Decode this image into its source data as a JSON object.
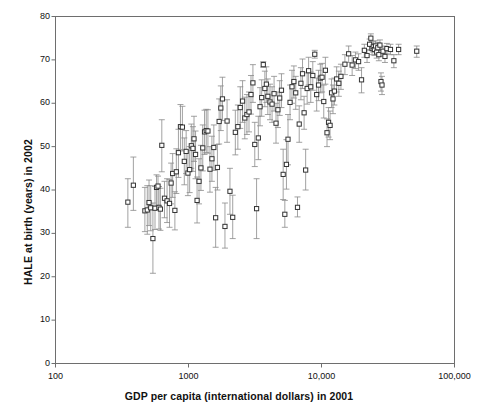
{
  "chart_data": {
    "type": "scatter",
    "title": "",
    "xlabel": "GDP per capita (international dollars) in 2001",
    "ylabel": "HALE at birth (years) in 2002",
    "xscale": "log",
    "yscale": "linear",
    "xlim": [
      100,
      100000
    ],
    "ylim": [
      0,
      80
    ],
    "xticks": [
      100,
      1000,
      10000,
      100000
    ],
    "xticklabels": [
      "100",
      "1000",
      "10,000",
      "100,000"
    ],
    "yticks": [
      0,
      10,
      20,
      30,
      40,
      50,
      60,
      70,
      80
    ],
    "yticklabels": [
      "0",
      "10",
      "20",
      "30",
      "40",
      "50",
      "60",
      "70",
      "80"
    ],
    "grid": false,
    "legend": null,
    "marker": "open-square",
    "marker_color": "#333333",
    "errorbar_color": "#8a8a8a",
    "errorbar_orientation": "vertical",
    "series": [
      {
        "name": "Countries",
        "points": [
          {
            "x": 350,
            "y": 37.2,
            "ylow": 31.4,
            "yhigh": 42.6
          },
          {
            "x": 385,
            "y": 41.1,
            "ylow": 35.3,
            "yhigh": 47.6
          },
          {
            "x": 470,
            "y": 35.2,
            "ylow": 30.4,
            "yhigh": 40.6
          },
          {
            "x": 490,
            "y": 35.4,
            "ylow": 29.8,
            "yhigh": 41.0
          },
          {
            "x": 505,
            "y": 37.1,
            "ylow": 31.8,
            "yhigh": 42.3
          },
          {
            "x": 520,
            "y": 35.9,
            "ylow": 30.6,
            "yhigh": 41.0
          },
          {
            "x": 540,
            "y": 28.8,
            "ylow": 20.8,
            "yhigh": 37.0
          },
          {
            "x": 560,
            "y": 35.8,
            "ylow": 30.9,
            "yhigh": 40.8
          },
          {
            "x": 575,
            "y": 40.6,
            "ylow": 35.7,
            "yhigh": 43.5
          },
          {
            "x": 590,
            "y": 40.9,
            "ylow": 36.3,
            "yhigh": 43.2
          },
          {
            "x": 600,
            "y": 36.0,
            "ylow": 31.0,
            "yhigh": 40.8
          },
          {
            "x": 615,
            "y": 35.6,
            "ylow": 30.7,
            "yhigh": 40.4
          },
          {
            "x": 630,
            "y": 50.3,
            "ylow": 44.2,
            "yhigh": 56.2
          },
          {
            "x": 660,
            "y": 38.1,
            "ylow": 33.6,
            "yhigh": 42.0
          },
          {
            "x": 690,
            "y": 37.5,
            "ylow": 32.5,
            "yhigh": 42.6
          },
          {
            "x": 720,
            "y": 36.9,
            "ylow": 31.4,
            "yhigh": 42.4
          },
          {
            "x": 740,
            "y": 41.6,
            "ylow": 36.8,
            "yhigh": 46.2
          },
          {
            "x": 760,
            "y": 43.8,
            "ylow": 38.3,
            "yhigh": 48.4
          },
          {
            "x": 790,
            "y": 35.3,
            "ylow": 30.8,
            "yhigh": 39.6
          },
          {
            "x": 810,
            "y": 44.2,
            "ylow": 39.2,
            "yhigh": 49.5
          },
          {
            "x": 840,
            "y": 48.6,
            "ylow": 42.9,
            "yhigh": 54.0
          },
          {
            "x": 870,
            "y": 54.6,
            "ylow": 49.3,
            "yhigh": 59.7
          },
          {
            "x": 900,
            "y": 54.5,
            "ylow": 49.0,
            "yhigh": 59.3
          },
          {
            "x": 930,
            "y": 46.6,
            "ylow": 41.2,
            "yhigh": 52.0
          },
          {
            "x": 960,
            "y": 48.9,
            "ylow": 43.8,
            "yhigh": 53.7
          },
          {
            "x": 990,
            "y": 43.9,
            "ylow": 38.7,
            "yhigh": 49.1
          },
          {
            "x": 1020,
            "y": 44.7,
            "ylow": 39.4,
            "yhigh": 50.0
          },
          {
            "x": 1050,
            "y": 50.2,
            "ylow": 45.0,
            "yhigh": 55.2
          },
          {
            "x": 1080,
            "y": 49.6,
            "ylow": 44.3,
            "yhigh": 54.6
          },
          {
            "x": 1100,
            "y": 51.8,
            "ylow": 46.6,
            "yhigh": 57.0
          },
          {
            "x": 1130,
            "y": 48.2,
            "ylow": 42.6,
            "yhigh": 53.6
          },
          {
            "x": 1160,
            "y": 37.6,
            "ylow": 32.4,
            "yhigh": 43.0
          },
          {
            "x": 1200,
            "y": 42.0,
            "ylow": 36.8,
            "yhigh": 47.2
          },
          {
            "x": 1240,
            "y": 45.1,
            "ylow": 39.9,
            "yhigh": 50.3
          },
          {
            "x": 1280,
            "y": 49.7,
            "ylow": 44.4,
            "yhigh": 55.0
          },
          {
            "x": 1320,
            "y": 53.4,
            "ylow": 48.2,
            "yhigh": 58.4
          },
          {
            "x": 1360,
            "y": 53.7,
            "ylow": 48.6,
            "yhigh": 58.6
          },
          {
            "x": 1400,
            "y": 53.6,
            "ylow": 48.5,
            "yhigh": 58.5
          },
          {
            "x": 1450,
            "y": 44.8,
            "ylow": 39.5,
            "yhigh": 50.0
          },
          {
            "x": 1500,
            "y": 47.2,
            "ylow": 42.0,
            "yhigh": 52.4
          },
          {
            "x": 1550,
            "y": 49.8,
            "ylow": 44.5,
            "yhigh": 55.0
          },
          {
            "x": 1600,
            "y": 33.6,
            "ylow": 26.8,
            "yhigh": 40.6
          },
          {
            "x": 1650,
            "y": 45.2,
            "ylow": 40.0,
            "yhigh": 50.5
          },
          {
            "x": 1700,
            "y": 55.8,
            "ylow": 50.6,
            "yhigh": 61.0
          },
          {
            "x": 1750,
            "y": 58.9,
            "ylow": 53.7,
            "yhigh": 64.0
          },
          {
            "x": 1800,
            "y": 61.0,
            "ylow": 56.0,
            "yhigh": 66.0
          },
          {
            "x": 1880,
            "y": 31.6,
            "ylow": 26.6,
            "yhigh": 37.0
          },
          {
            "x": 1950,
            "y": 55.9,
            "ylow": 51.0,
            "yhigh": 60.8
          },
          {
            "x": 2050,
            "y": 39.7,
            "ylow": 34.4,
            "yhigh": 45.0
          },
          {
            "x": 2150,
            "y": 33.7,
            "ylow": 28.8,
            "yhigh": 38.8
          },
          {
            "x": 2250,
            "y": 53.3,
            "ylow": 48.1,
            "yhigh": 58.4
          },
          {
            "x": 2350,
            "y": 54.6,
            "ylow": 49.4,
            "yhigh": 59.6
          },
          {
            "x": 2450,
            "y": 59.0,
            "ylow": 54.2,
            "yhigh": 63.8
          },
          {
            "x": 2550,
            "y": 60.5,
            "ylow": 55.6,
            "yhigh": 65.2
          },
          {
            "x": 2650,
            "y": 56.6,
            "ylow": 51.8,
            "yhigh": 61.4
          },
          {
            "x": 2750,
            "y": 57.4,
            "ylow": 52.8,
            "yhigh": 62.0
          },
          {
            "x": 2850,
            "y": 58.0,
            "ylow": 53.4,
            "yhigh": 62.6
          },
          {
            "x": 2950,
            "y": 62.0,
            "ylow": 57.5,
            "yhigh": 66.4
          },
          {
            "x": 3050,
            "y": 64.7,
            "ylow": 60.2,
            "yhigh": 68.9
          },
          {
            "x": 3150,
            "y": 50.5,
            "ylow": 45.4,
            "yhigh": 55.6
          },
          {
            "x": 3250,
            "y": 35.7,
            "ylow": 28.8,
            "yhigh": 42.6
          },
          {
            "x": 3350,
            "y": 52.0,
            "ylow": 47.0,
            "yhigh": 57.0
          },
          {
            "x": 3450,
            "y": 59.2,
            "ylow": 54.8,
            "yhigh": 63.6
          },
          {
            "x": 3550,
            "y": 61.3,
            "ylow": 57.0,
            "yhigh": 65.4
          },
          {
            "x": 3650,
            "y": 68.9,
            "ylow": 68.3,
            "yhigh": 69.6
          },
          {
            "x": 3750,
            "y": 63.4,
            "ylow": 59.2,
            "yhigh": 67.4
          },
          {
            "x": 3850,
            "y": 64.4,
            "ylow": 60.2,
            "yhigh": 68.4
          },
          {
            "x": 3950,
            "y": 61.6,
            "ylow": 57.4,
            "yhigh": 65.6
          },
          {
            "x": 4100,
            "y": 60.3,
            "ylow": 56.2,
            "yhigh": 64.4
          },
          {
            "x": 4250,
            "y": 59.8,
            "ylow": 55.6,
            "yhigh": 63.8
          },
          {
            "x": 4400,
            "y": 62.2,
            "ylow": 58.2,
            "yhigh": 66.2
          },
          {
            "x": 4550,
            "y": 55.4,
            "ylow": 50.8,
            "yhigh": 60.0
          },
          {
            "x": 4700,
            "y": 58.5,
            "ylow": 54.4,
            "yhigh": 62.6
          },
          {
            "x": 4850,
            "y": 61.2,
            "ylow": 57.2,
            "yhigh": 65.2
          },
          {
            "x": 5000,
            "y": 63.0,
            "ylow": 59.0,
            "yhigh": 66.8
          },
          {
            "x": 5150,
            "y": 43.6,
            "ylow": 37.8,
            "yhigh": 49.4
          },
          {
            "x": 5300,
            "y": 34.4,
            "ylow": 31.4,
            "yhigh": 37.6
          },
          {
            "x": 5450,
            "y": 45.9,
            "ylow": 40.2,
            "yhigh": 51.6
          },
          {
            "x": 5600,
            "y": 51.7,
            "ylow": 45.8,
            "yhigh": 57.4
          },
          {
            "x": 5800,
            "y": 60.2,
            "ylow": 56.2,
            "yhigh": 64.2
          },
          {
            "x": 6000,
            "y": 63.8,
            "ylow": 60.0,
            "yhigh": 67.6
          },
          {
            "x": 6200,
            "y": 65.0,
            "ylow": 61.2,
            "yhigh": 68.6
          },
          {
            "x": 6400,
            "y": 62.4,
            "ylow": 58.6,
            "yhigh": 66.2
          },
          {
            "x": 6600,
            "y": 36.0,
            "ylow": 33.8,
            "yhigh": 38.4
          },
          {
            "x": 6800,
            "y": 55.2,
            "ylow": 51.0,
            "yhigh": 59.4
          },
          {
            "x": 7000,
            "y": 64.6,
            "ylow": 60.8,
            "yhigh": 68.2
          },
          {
            "x": 7200,
            "y": 66.8,
            "ylow": 63.4,
            "yhigh": 70.2
          },
          {
            "x": 7400,
            "y": 57.8,
            "ylow": 54.0,
            "yhigh": 61.6
          },
          {
            "x": 7600,
            "y": 44.6,
            "ylow": 40.0,
            "yhigh": 49.4
          },
          {
            "x": 7800,
            "y": 63.4,
            "ylow": 59.8,
            "yhigh": 67.0
          },
          {
            "x": 8000,
            "y": 67.5,
            "ylow": 64.2,
            "yhigh": 70.6
          },
          {
            "x": 8300,
            "y": 63.8,
            "ylow": 60.2,
            "yhigh": 67.2
          },
          {
            "x": 8600,
            "y": 66.4,
            "ylow": 63.0,
            "yhigh": 69.6
          },
          {
            "x": 8900,
            "y": 71.3,
            "ylow": 70.4,
            "yhigh": 72.2
          },
          {
            "x": 9200,
            "y": 62.0,
            "ylow": 58.2,
            "yhigh": 65.8
          },
          {
            "x": 9500,
            "y": 64.2,
            "ylow": 60.6,
            "yhigh": 67.6
          },
          {
            "x": 9800,
            "y": 65.8,
            "ylow": 62.4,
            "yhigh": 69.0
          },
          {
            "x": 10100,
            "y": 66.0,
            "ylow": 62.6,
            "yhigh": 69.2
          },
          {
            "x": 10400,
            "y": 60.4,
            "ylow": 56.6,
            "yhigh": 64.2
          },
          {
            "x": 10700,
            "y": 67.6,
            "ylow": 64.4,
            "yhigh": 70.6
          },
          {
            "x": 11000,
            "y": 53.2,
            "ylow": 50.0,
            "yhigh": 56.4
          },
          {
            "x": 11300,
            "y": 55.6,
            "ylow": 52.2,
            "yhigh": 59.0
          },
          {
            "x": 11600,
            "y": 54.9,
            "ylow": 51.6,
            "yhigh": 58.2
          },
          {
            "x": 11900,
            "y": 62.4,
            "ylow": 59.0,
            "yhigh": 65.6
          },
          {
            "x": 12200,
            "y": 61.0,
            "ylow": 57.6,
            "yhigh": 64.2
          },
          {
            "x": 12500,
            "y": 62.8,
            "ylow": 59.6,
            "yhigh": 65.8
          },
          {
            "x": 13000,
            "y": 65.6,
            "ylow": 62.6,
            "yhigh": 68.4
          },
          {
            "x": 13500,
            "y": 64.6,
            "ylow": 61.6,
            "yhigh": 67.4
          },
          {
            "x": 14000,
            "y": 66.2,
            "ylow": 63.2,
            "yhigh": 69.0
          },
          {
            "x": 15000,
            "y": 69.0,
            "ylow": 66.6,
            "yhigh": 71.2
          },
          {
            "x": 16000,
            "y": 71.4,
            "ylow": 69.4,
            "yhigh": 73.2
          },
          {
            "x": 17000,
            "y": 68.8,
            "ylow": 66.4,
            "yhigh": 71.0
          },
          {
            "x": 18000,
            "y": 70.0,
            "ylow": 68.0,
            "yhigh": 71.8
          },
          {
            "x": 19000,
            "y": 69.6,
            "ylow": 67.6,
            "yhigh": 71.4
          },
          {
            "x": 20000,
            "y": 65.4,
            "ylow": 62.4,
            "yhigh": 68.2
          },
          {
            "x": 21000,
            "y": 72.2,
            "ylow": 70.6,
            "yhigh": 73.6
          },
          {
            "x": 22000,
            "y": 71.0,
            "ylow": 69.4,
            "yhigh": 72.4
          },
          {
            "x": 23000,
            "y": 73.6,
            "ylow": 72.2,
            "yhigh": 74.8
          },
          {
            "x": 23500,
            "y": 75.0,
            "ylow": 73.8,
            "yhigh": 76.0
          },
          {
            "x": 24000,
            "y": 72.6,
            "ylow": 71.2,
            "yhigh": 73.8
          },
          {
            "x": 24500,
            "y": 73.0,
            "ylow": 71.8,
            "yhigh": 74.2
          },
          {
            "x": 25000,
            "y": 72.4,
            "ylow": 71.0,
            "yhigh": 73.6
          },
          {
            "x": 25500,
            "y": 73.2,
            "ylow": 72.0,
            "yhigh": 74.4
          },
          {
            "x": 26000,
            "y": 71.8,
            "ylow": 70.4,
            "yhigh": 73.0
          },
          {
            "x": 26500,
            "y": 72.8,
            "ylow": 71.6,
            "yhigh": 74.0
          },
          {
            "x": 27000,
            "y": 71.2,
            "ylow": 69.8,
            "yhigh": 72.4
          },
          {
            "x": 27500,
            "y": 73.4,
            "ylow": 72.2,
            "yhigh": 74.6
          },
          {
            "x": 28000,
            "y": 65.0,
            "ylow": 62.8,
            "yhigh": 67.0
          },
          {
            "x": 28500,
            "y": 64.2,
            "ylow": 62.0,
            "yhigh": 66.2
          },
          {
            "x": 29000,
            "y": 72.0,
            "ylow": 70.8,
            "yhigh": 73.2
          },
          {
            "x": 30000,
            "y": 70.8,
            "ylow": 69.4,
            "yhigh": 72.0
          },
          {
            "x": 31000,
            "y": 72.6,
            "ylow": 71.4,
            "yhigh": 73.8
          },
          {
            "x": 33000,
            "y": 72.4,
            "ylow": 71.2,
            "yhigh": 73.6
          },
          {
            "x": 35000,
            "y": 69.8,
            "ylow": 68.2,
            "yhigh": 71.2
          },
          {
            "x": 38000,
            "y": 72.4,
            "ylow": 71.2,
            "yhigh": 73.6
          },
          {
            "x": 52000,
            "y": 72.0,
            "ylow": 70.6,
            "yhigh": 73.2
          }
        ]
      }
    ]
  },
  "axes": {
    "x_title": "GDP per capita (international dollars) in 2001",
    "y_title": "HALE at birth (years) in 2002"
  }
}
